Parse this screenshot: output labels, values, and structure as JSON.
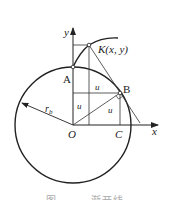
{
  "diagram": {
    "labels": {
      "y_axis": "y",
      "x_axis": "x",
      "origin": "O",
      "point_a": "A",
      "point_b": "B",
      "point_c": "C",
      "point_k": "K(x, y)",
      "radius": "r",
      "radius_sub": "b",
      "u1": "u",
      "u2": "u",
      "u3": "u"
    },
    "caption": "图 — — 渐开线"
  }
}
